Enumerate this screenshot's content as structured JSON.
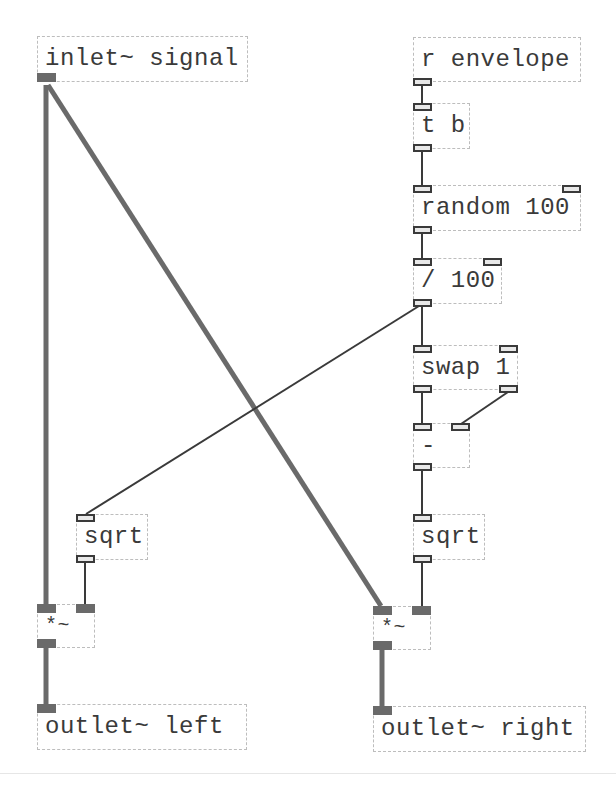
{
  "patch": {
    "colors": {
      "background": "#ffffff",
      "box_border": "#bdbdbd",
      "text": "#3a3a3a",
      "signal_wire": "#6a6a6a",
      "control_wire": "#3a3a3a"
    },
    "objects": {
      "inlet_signal": {
        "label": "inlet~ signal"
      },
      "r_envelope": {
        "label": "r envelope"
      },
      "t_b": {
        "label": "t b"
      },
      "random_100": {
        "label": "random 100"
      },
      "div_100": {
        "label": "/ 100"
      },
      "swap_1": {
        "label": "swap 1"
      },
      "minus": {
        "label": "-"
      },
      "sqrt_right": {
        "label": "sqrt"
      },
      "sqrt_left": {
        "label": "sqrt"
      },
      "mul_left": {
        "label": "*~"
      },
      "mul_right": {
        "label": "*~"
      },
      "outlet_left": {
        "label": "outlet~ left"
      },
      "outlet_right": {
        "label": "outlet~ right"
      }
    },
    "connections": [
      {
        "from": "inlet~ signal",
        "to": "*~ (left)",
        "type": "signal"
      },
      {
        "from": "inlet~ signal",
        "to": "*~ (right)",
        "type": "signal"
      },
      {
        "from": "r envelope",
        "to": "t b",
        "type": "control"
      },
      {
        "from": "t b",
        "to": "random 100",
        "type": "control"
      },
      {
        "from": "random 100",
        "to": "/ 100",
        "type": "control"
      },
      {
        "from": "/ 100",
        "to": "swap 1",
        "type": "control"
      },
      {
        "from": "/ 100",
        "to": "sqrt (left)",
        "type": "control"
      },
      {
        "from": "swap 1 (left outlet)",
        "to": "- (left inlet)",
        "type": "control"
      },
      {
        "from": "swap 1 (right outlet)",
        "to": "- (right inlet)",
        "type": "control"
      },
      {
        "from": "-",
        "to": "sqrt (right)",
        "type": "control"
      },
      {
        "from": "sqrt (left)",
        "to": "*~ (left) right inlet",
        "type": "control"
      },
      {
        "from": "sqrt (right)",
        "to": "*~ (right) right inlet",
        "type": "control"
      },
      {
        "from": "*~ (left)",
        "to": "outlet~ left",
        "type": "signal"
      },
      {
        "from": "*~ (right)",
        "to": "outlet~ right",
        "type": "signal"
      }
    ]
  }
}
